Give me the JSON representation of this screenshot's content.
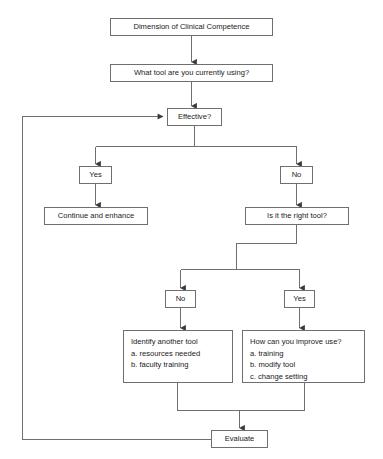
{
  "diagram": {
    "line_color": "#6f6f6f",
    "text_color": "#1a1a1a",
    "background": "#ffffff"
  },
  "nodes": {
    "dimension": {
      "label": "Dimension of Clinical Competence"
    },
    "what_tool": {
      "label": "What tool are you currently using?"
    },
    "effective": {
      "label": "Effective?"
    },
    "yes_branch": {
      "label": "Yes"
    },
    "no_branch": {
      "label": "No"
    },
    "continue_enhance": {
      "label": "Continue and enhance"
    },
    "right_tool": {
      "label": "Is it the right tool?"
    },
    "no_branch2": {
      "label": "No"
    },
    "yes_branch2": {
      "label": "Yes"
    },
    "identify_tool": {
      "lines": [
        "Identify another tool",
        "a. resources needed",
        "b. faculty training"
      ]
    },
    "improve_use": {
      "lines": [
        "How can you improve use?",
        "a. training",
        "b. modify tool",
        "c. change setting"
      ]
    },
    "evaluate": {
      "label": "Evaluate"
    }
  },
  "edges": [
    {
      "from": "dimension",
      "to": "what_tool",
      "kind": "arrow-down"
    },
    {
      "from": "what_tool",
      "to": "effective",
      "kind": "arrow-down"
    },
    {
      "from": "effective",
      "to": "yes_branch",
      "kind": "split-left-arrow-down"
    },
    {
      "from": "effective",
      "to": "no_branch",
      "kind": "split-right-arrow-down"
    },
    {
      "from": "yes_branch",
      "to": "continue_enhance",
      "kind": "arrow-down"
    },
    {
      "from": "no_branch",
      "to": "right_tool",
      "kind": "arrow-down"
    },
    {
      "from": "right_tool",
      "to": "no_branch2",
      "kind": "step-split-left-arrow-down"
    },
    {
      "from": "right_tool",
      "to": "yes_branch2",
      "kind": "step-split-right-arrow-down"
    },
    {
      "from": "no_branch2",
      "to": "identify_tool",
      "kind": "arrow-down"
    },
    {
      "from": "yes_branch2",
      "to": "improve_use",
      "kind": "arrow-down"
    },
    {
      "from": "identify_tool",
      "to": "evaluate",
      "kind": "merge-arrow-down"
    },
    {
      "from": "improve_use",
      "to": "evaluate",
      "kind": "merge-arrow-down"
    },
    {
      "from": "evaluate",
      "to": "effective",
      "kind": "feedback-loop-left-arrow-right"
    }
  ]
}
